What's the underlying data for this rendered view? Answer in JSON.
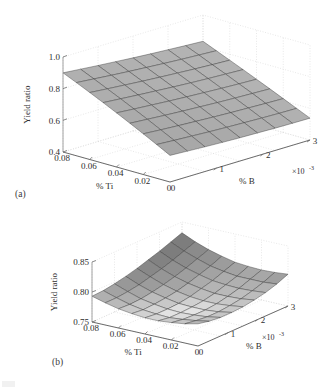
{
  "figure": {
    "background_color": "#ffffff",
    "panels": [
      {
        "id": "a",
        "label": "(a)",
        "zlabel": "Yield ratio",
        "xlabel": "% Ti",
        "ylabel": "% B",
        "y_exponent_base": "×10",
        "y_exponent_power": "-3",
        "z_ticks": [
          "1.0",
          "0.8",
          "0.6",
          "0.4"
        ],
        "x_ticks": [
          "0.08",
          "0.06",
          "0.04",
          "0.02",
          "0"
        ],
        "y_ticks": [
          "0",
          "1",
          "2",
          "3"
        ]
      },
      {
        "id": "b",
        "label": "(b)",
        "zlabel": "Yield ratio",
        "xlabel": "% Ti",
        "ylabel": "% B",
        "y_exponent_base": "×10",
        "y_exponent_power": "-3",
        "z_ticks": [
          "0.85",
          "0.80",
          "0.75"
        ],
        "x_ticks": [
          "0.08",
          "0.06",
          "0.04",
          "0.02",
          "0"
        ],
        "y_ticks": [
          "0",
          "1",
          "2",
          "3"
        ]
      }
    ]
  },
  "chart_data": [
    {
      "type": "surface",
      "panel": "a",
      "title": "",
      "xlabel": "% Ti",
      "ylabel": "% B",
      "zlabel": "Yield ratio",
      "x": [
        0.08,
        0.07,
        0.06,
        0.05,
        0.04,
        0.03,
        0.02,
        0.01,
        0.0
      ],
      "y": [
        0.0,
        0.000375,
        0.00075,
        0.001125,
        0.0015,
        0.001875,
        0.00225,
        0.002625,
        0.003
      ],
      "xlim": [
        0.0,
        0.08
      ],
      "ylim": [
        0.0,
        0.003
      ],
      "zlim": [
        0.4,
        1.0
      ],
      "grid": true,
      "colormap": "grayscale",
      "z": [
        [
          0.9,
          0.89,
          0.88,
          0.871,
          0.862,
          0.854,
          0.847,
          0.84,
          0.834
        ],
        [
          0.862,
          0.852,
          0.842,
          0.833,
          0.825,
          0.817,
          0.81,
          0.804,
          0.798
        ],
        [
          0.823,
          0.813,
          0.804,
          0.795,
          0.787,
          0.78,
          0.773,
          0.767,
          0.762
        ],
        [
          0.783,
          0.774,
          0.765,
          0.757,
          0.749,
          0.742,
          0.736,
          0.731,
          0.726
        ],
        [
          0.742,
          0.733,
          0.725,
          0.717,
          0.71,
          0.704,
          0.698,
          0.693,
          0.689
        ],
        [
          0.7,
          0.692,
          0.684,
          0.677,
          0.671,
          0.665,
          0.66,
          0.656,
          0.652
        ],
        [
          0.657,
          0.649,
          0.642,
          0.636,
          0.63,
          0.625,
          0.621,
          0.617,
          0.614
        ],
        [
          0.613,
          0.606,
          0.6,
          0.594,
          0.589,
          0.585,
          0.581,
          0.578,
          0.576
        ],
        [
          0.568,
          0.562,
          0.556,
          0.551,
          0.547,
          0.544,
          0.541,
          0.539,
          0.538
        ]
      ]
    },
    {
      "type": "surface",
      "panel": "b",
      "title": "",
      "xlabel": "% Ti",
      "ylabel": "% B",
      "zlabel": "Yield ratio",
      "x": [
        0.08,
        0.07,
        0.06,
        0.05,
        0.04,
        0.03,
        0.02,
        0.01,
        0.0
      ],
      "y": [
        0.0,
        0.000375,
        0.00075,
        0.001125,
        0.0015,
        0.001875,
        0.00225,
        0.002625,
        0.003
      ],
      "xlim": [
        0.0,
        0.08
      ],
      "ylim": [
        0.0,
        0.003
      ],
      "zlim": [
        0.75,
        0.85
      ],
      "grid": true,
      "colormap": "grayscale",
      "z": [
        [
          0.793,
          0.794,
          0.797,
          0.801,
          0.806,
          0.812,
          0.818,
          0.825,
          0.832
        ],
        [
          0.787,
          0.787,
          0.789,
          0.792,
          0.797,
          0.802,
          0.808,
          0.815,
          0.822
        ],
        [
          0.782,
          0.781,
          0.782,
          0.785,
          0.789,
          0.794,
          0.8,
          0.807,
          0.814
        ],
        [
          0.779,
          0.777,
          0.778,
          0.78,
          0.783,
          0.788,
          0.794,
          0.8,
          0.808
        ],
        [
          0.777,
          0.775,
          0.775,
          0.776,
          0.779,
          0.784,
          0.789,
          0.796,
          0.803
        ],
        [
          0.777,
          0.774,
          0.774,
          0.775,
          0.777,
          0.781,
          0.787,
          0.793,
          0.801
        ],
        [
          0.779,
          0.776,
          0.775,
          0.775,
          0.777,
          0.781,
          0.786,
          0.793,
          0.8
        ],
        [
          0.782,
          0.779,
          0.777,
          0.777,
          0.779,
          0.782,
          0.787,
          0.793,
          0.801
        ],
        [
          0.787,
          0.783,
          0.781,
          0.781,
          0.782,
          0.785,
          0.789,
          0.795,
          0.803
        ]
      ]
    }
  ]
}
